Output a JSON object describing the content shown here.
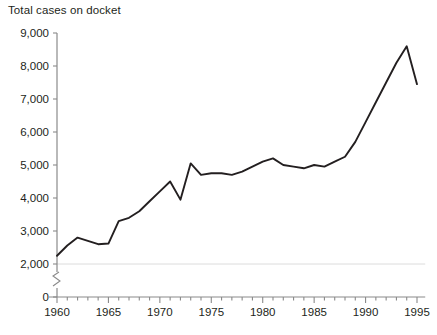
{
  "chart_data": {
    "type": "line",
    "title": "Total cases on docket",
    "xlabel": "",
    "ylabel": "",
    "xlim": [
      1959.4,
      1995.8
    ],
    "ylim": [
      0,
      9000
    ],
    "y_axis_break": true,
    "y_break_range": [
      0,
      2000
    ],
    "grid": "single horizontal gridline at 2,000",
    "legend": "none",
    "y_ticks": [
      0,
      2000,
      3000,
      4000,
      5000,
      6000,
      7000,
      8000,
      9000
    ],
    "y_tick_labels": [
      "0",
      "2,000",
      "3,000",
      "4,000",
      "5,000",
      "6,000",
      "7,000",
      "8,000",
      "9,000"
    ],
    "x_ticks_major": [
      1960,
      1965,
      1970,
      1975,
      1980,
      1985,
      1990,
      1995
    ],
    "x_tick_labels": [
      "1960",
      "1965",
      "1970",
      "1975",
      "1980",
      "1985",
      "1990",
      "1995"
    ],
    "x_minor_tick_interval": 1,
    "line_color": "#231f20",
    "x": [
      1960,
      1961,
      1962,
      1963,
      1964,
      1965,
      1966,
      1967,
      1968,
      1969,
      1970,
      1971,
      1972,
      1973,
      1974,
      1975,
      1976,
      1977,
      1978,
      1979,
      1980,
      1981,
      1982,
      1983,
      1984,
      1985,
      1986,
      1987,
      1988,
      1989,
      1990,
      1991,
      1992,
      1993,
      1994,
      1995
    ],
    "values": [
      2250,
      2560,
      2800,
      2700,
      2600,
      2620,
      3300,
      3400,
      3600,
      3900,
      4200,
      4500,
      3950,
      5050,
      4700,
      4750,
      4750,
      4700,
      4800,
      4950,
      5100,
      5200,
      5000,
      4950,
      4900,
      5000,
      4950,
      5100,
      5250,
      5700,
      6300,
      6900,
      7500,
      8100,
      8600,
      7450
    ],
    "series_name": "Total cases on docket"
  }
}
